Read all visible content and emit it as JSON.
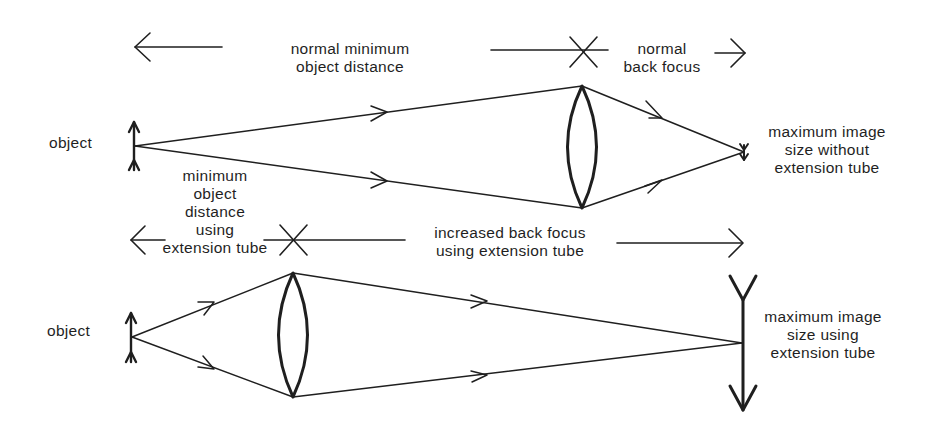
{
  "top_diagram": {
    "title_left": [
      "normal minimum",
      "object distance"
    ],
    "title_right": [
      "normal",
      "back focus"
    ],
    "object_label": "object",
    "image_label": [
      "maximum image",
      "size without",
      "extension tube"
    ]
  },
  "bottom_diagram": {
    "title_left": [
      "minimum",
      "object",
      "distance",
      "using",
      "extension tube"
    ],
    "title_right": [
      "increased back focus",
      "using extension tube"
    ],
    "object_label": "object",
    "image_label": [
      "maximum image",
      "size using",
      "extension tube"
    ]
  },
  "colors": {
    "ink": "#1f1f1f",
    "background": "#ffffff"
  }
}
